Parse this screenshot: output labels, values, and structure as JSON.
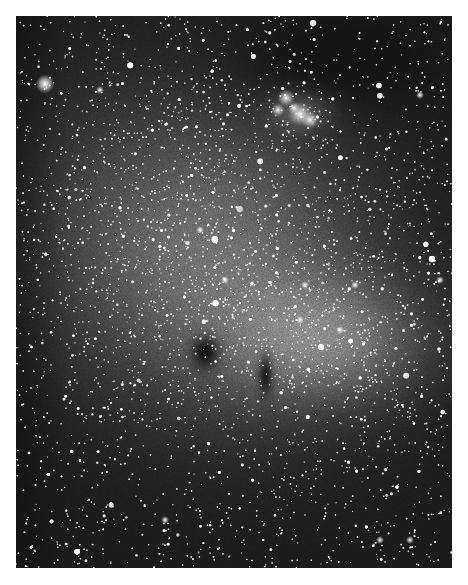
{
  "image": {
    "kind": "astronomical photograph",
    "description": "Black-and-white star field: dense Milky Way star cloud with a small dark nebula and a bright nebulous cluster at upper right",
    "frame": {
      "x": 16,
      "y": 16,
      "width": 436,
      "height": 552
    },
    "palette": {
      "background": "#ffffff",
      "sky": "#0b0b0b",
      "cloud": "#9a9a9a",
      "star": "#ffffff"
    },
    "features": [
      {
        "name": "star-cloud",
        "cx": 210,
        "cy": 260,
        "rx": 200,
        "ry": 190,
        "intensity": 0.62
      },
      {
        "name": "star-cloud-lower-right",
        "cx": 330,
        "cy": 340,
        "rx": 110,
        "ry": 70,
        "intensity": 0.5
      },
      {
        "name": "nebulous-cluster",
        "cx": 300,
        "cy": 110,
        "rx": 38,
        "ry": 26,
        "intensity": 0.9
      },
      {
        "name": "dark-nebula-globule",
        "cx": 205,
        "cy": 352,
        "rx": 18,
        "ry": 22
      },
      {
        "name": "dark-lane-right",
        "cx": 265,
        "cy": 375,
        "rx": 10,
        "ry": 28
      },
      {
        "name": "dark-region-upper-right",
        "cx": 330,
        "cy": 60,
        "rx": 110,
        "ry": 55
      },
      {
        "name": "bright-star-left",
        "cx": 45,
        "cy": 84,
        "r": 6
      }
    ]
  }
}
